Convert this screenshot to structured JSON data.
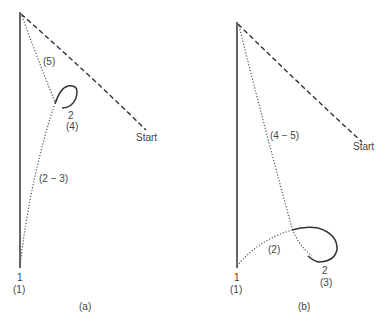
{
  "panel_a": {
    "caption": "(a)",
    "labels": {
      "seg5": "(5)",
      "node2": "2",
      "node2_sub": "(4)",
      "start": "Start",
      "seg23": "(2 − 3)",
      "node1": "1",
      "node1_sub": "(1)"
    }
  },
  "panel_b": {
    "caption": "(b)",
    "labels": {
      "seg45": "(4 − 5)",
      "start": "Start",
      "seg2": "(2)",
      "node2": "2",
      "node2_sub": "(3)",
      "node1": "1",
      "node1_sub": "(1)"
    }
  },
  "colors": {
    "line": "#333333",
    "text": "#444444"
  }
}
